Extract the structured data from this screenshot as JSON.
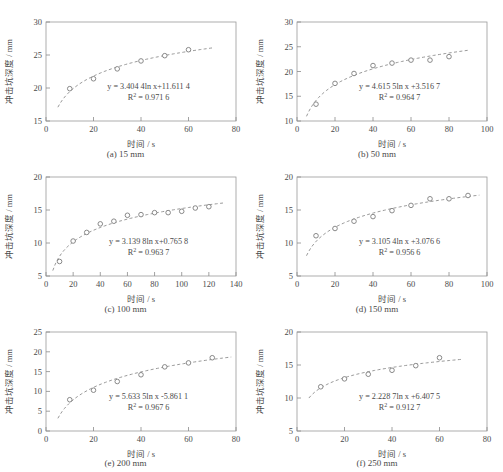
{
  "page": {
    "top_text_fragment": "",
    "axis_x_label": "时间 / s",
    "axis_y_label": "冲击坑深度 / mm"
  },
  "chart_data": [
    {
      "type": "scatter",
      "panel": "a",
      "caption": "(a)  15 mm",
      "caption_index": "(a)",
      "caption_value": "15 mm",
      "title": "",
      "xlabel": "时间 / s",
      "ylabel": "冲击坑深度 / mm",
      "xlim": [
        0,
        80
      ],
      "ylim": [
        15,
        30
      ],
      "xticks": [
        0,
        20,
        40,
        60,
        80
      ],
      "yticks": [
        15,
        20,
        25,
        30
      ],
      "grid": false,
      "equation": "y = 3.404 4ln x+11.611 4",
      "r2": "R2 = 0.971 6",
      "fit": {
        "a": 3.4044,
        "b": 11.6114,
        "x_start": 5,
        "x_end": 70
      },
      "x": [
        10,
        20,
        30,
        40,
        50,
        60
      ],
      "y": [
        19.9,
        21.4,
        22.9,
        24.1,
        24.9,
        25.8
      ]
    },
    {
      "type": "scatter",
      "panel": "b",
      "caption": "(b)  50 mm",
      "caption_index": "(b)",
      "caption_value": "50 mm",
      "title": "",
      "xlabel": "时间 / s",
      "ylabel": "冲击坑深度 / mm",
      "xlim": [
        0,
        100
      ],
      "ylim": [
        10,
        30
      ],
      "xticks": [
        0,
        20,
        40,
        60,
        80,
        100
      ],
      "yticks": [
        10,
        15,
        20,
        25,
        30
      ],
      "grid": false,
      "equation": "y = 4.615 5ln x +3.516 7",
      "r2": "R2 = 0.964 7",
      "fit": {
        "a": 4.6155,
        "b": 3.5167,
        "x_start": 5,
        "x_end": 90
      },
      "x": [
        10,
        20,
        30,
        40,
        50,
        60,
        70,
        80
      ],
      "y": [
        13.4,
        17.6,
        19.6,
        21.2,
        21.7,
        22.3,
        22.3,
        23.0
      ]
    },
    {
      "type": "scatter",
      "panel": "c",
      "caption": "(c)  100 mm",
      "caption_index": "(c)",
      "caption_value": "100 mm",
      "title": "",
      "xlabel": "时间 / s",
      "ylabel": "冲击坑深度 / mm",
      "xlim": [
        0,
        140
      ],
      "ylim": [
        5,
        20
      ],
      "xticks": [
        0,
        20,
        40,
        60,
        80,
        100,
        120,
        140
      ],
      "yticks": [
        5,
        10,
        15,
        20
      ],
      "grid": false,
      "equation": "y = 3.139 8ln x+0.765 8",
      "r2": "R2 = 0.963 7",
      "fit": {
        "a": 3.1398,
        "b": 0.7658,
        "x_start": 5,
        "x_end": 132
      },
      "x": [
        10,
        20,
        30,
        40,
        50,
        60,
        70,
        80,
        90,
        100,
        110,
        120
      ],
      "y": [
        7.2,
        10.3,
        11.6,
        12.9,
        13.3,
        14.2,
        14.3,
        14.6,
        14.6,
        14.8,
        15.3,
        15.5
      ]
    },
    {
      "type": "scatter",
      "panel": "d",
      "caption": "(d)  150 mm",
      "caption_index": "(d)",
      "caption_value": "150 mm",
      "title": "",
      "xlabel": "时间 / s",
      "ylabel": "冲击坑深度 / mm",
      "xlim": [
        0,
        100
      ],
      "ylim": [
        5,
        20
      ],
      "xticks": [
        0,
        20,
        40,
        60,
        80,
        100
      ],
      "yticks": [
        5,
        10,
        15,
        20
      ],
      "grid": false,
      "equation": "y = 3.105 4ln x +3.076 6",
      "r2": "R2 = 0.956 6",
      "fit": {
        "a": 3.1054,
        "b": 3.0766,
        "x_start": 5,
        "x_end": 96
      },
      "x": [
        10,
        20,
        30,
        40,
        50,
        60,
        70,
        80,
        90
      ],
      "y": [
        11.1,
        12.2,
        13.3,
        14.0,
        14.9,
        15.7,
        16.7,
        16.7,
        17.2
      ]
    },
    {
      "type": "scatter",
      "panel": "e",
      "caption": "(e)  200 mm",
      "caption_index": "(e)",
      "caption_value": "200 mm",
      "title": "",
      "xlabel": "时间 / s",
      "ylabel": "冲击坑深度 / mm",
      "xlim": [
        0,
        80
      ],
      "ylim": [
        0,
        25
      ],
      "xticks": [
        0,
        20,
        40,
        60,
        80
      ],
      "yticks": [
        0,
        5,
        10,
        15,
        20,
        25
      ],
      "grid": false,
      "equation": "y = 5.633 5ln x -5.861 1",
      "r2": "R2 = 0.967 6",
      "fit": {
        "a": 5.6335,
        "b": -5.8611,
        "x_start": 5,
        "x_end": 78
      },
      "x": [
        10,
        20,
        30,
        40,
        50,
        60,
        70
      ],
      "y": [
        7.9,
        10.3,
        12.5,
        14.2,
        16.2,
        17.2,
        18.5
      ]
    },
    {
      "type": "scatter",
      "panel": "f",
      "caption": "(f)  250 mm",
      "caption_index": "(f)",
      "caption_value": "250 mm",
      "title": "",
      "xlabel": "时间 / s",
      "ylabel": "冲击坑深度 / mm",
      "xlim": [
        0,
        80
      ],
      "ylim": [
        5,
        20
      ],
      "xticks": [
        0,
        20,
        40,
        60,
        80
      ],
      "yticks": [
        5,
        10,
        15,
        20
      ],
      "grid": false,
      "equation": "y = 2.228 7ln x +6.407 5",
      "r2": "R2 = 0.912 7",
      "fit": {
        "a": 2.2287,
        "b": 6.4075,
        "x_start": 5,
        "x_end": 70
      },
      "x": [
        10,
        20,
        30,
        40,
        50,
        60
      ],
      "y": [
        11.7,
        12.9,
        13.6,
        14.2,
        14.9,
        16.1
      ]
    }
  ],
  "colors": {
    "axis": "#8a8a8a",
    "marker_stroke": "#7d7d7d",
    "curve": "#8d8d8d",
    "text": "#4a4a4a",
    "background": "#ffffff"
  }
}
